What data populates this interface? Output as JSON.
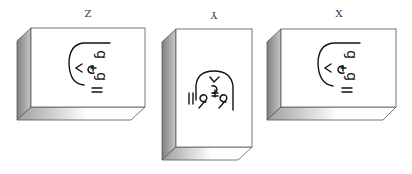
{
  "diagram": {
    "colors": {
      "outline": "#555555",
      "front_face": "#ffffff",
      "side_dark": "#8a8a8a",
      "side_light": "#d0d0d0",
      "bottom_dark": "#a8a8a8",
      "bottom_light": "#ffffff",
      "glyph": "#111111"
    },
    "panels": [
      {
        "id": "z",
        "label": "Z",
        "label_rotated": false,
        "orientation": "landscape"
      },
      {
        "id": "y",
        "label": "Y",
        "label_rotated": true,
        "orientation": "portrait"
      },
      {
        "id": "x",
        "label": "X",
        "label_rotated": false,
        "orientation": "landscape"
      }
    ]
  }
}
